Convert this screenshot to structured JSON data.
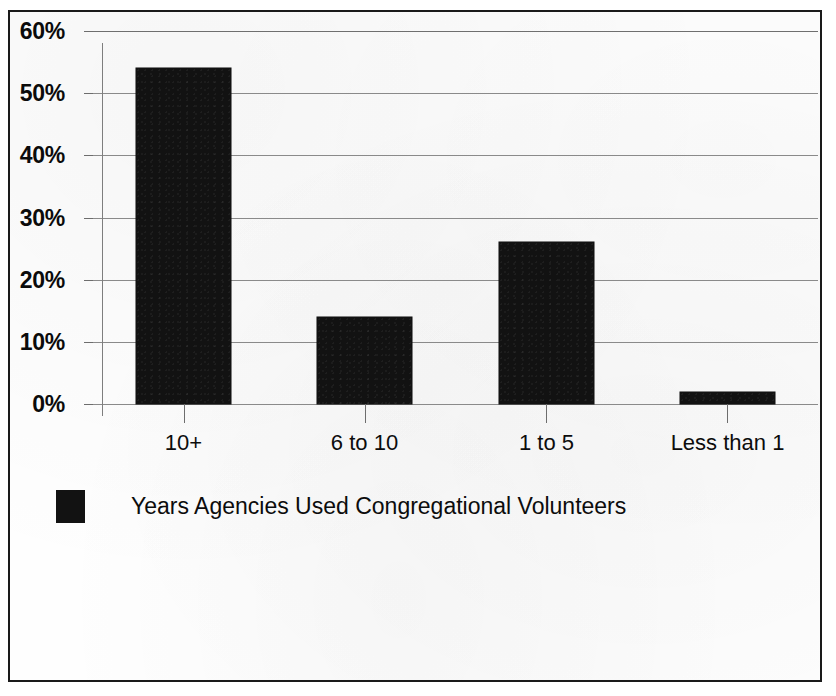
{
  "chart_data": {
    "type": "bar",
    "title": "",
    "subtitle": "",
    "xlabel": "",
    "ylabel": "",
    "categories": [
      "10+",
      "6 to 10",
      "1 to 5",
      "Less than 1"
    ],
    "values": [
      54,
      14,
      26,
      2
    ],
    "value_format": "percent",
    "ylim": [
      0,
      60
    ],
    "ytick_values": [
      60,
      50,
      40,
      30,
      20,
      10,
      0
    ],
    "ytick_labels": [
      "60%",
      "50%",
      "40%",
      "30%",
      "20%",
      "10%",
      "0%"
    ],
    "grid": true,
    "grid_axis": "y",
    "legend": {
      "position": "bottom-left",
      "entries": [
        {
          "label": "Years Agencies Used Congregational Volunteers",
          "color": "#121212"
        }
      ]
    },
    "series": [
      {
        "name": "Years Agencies Used Congregational Volunteers",
        "color": "#121212",
        "values": [
          54,
          14,
          26,
          2
        ]
      }
    ],
    "colors": {
      "bar": "#121212",
      "gridline": "#8a8a8a",
      "axis": "#7e7e7e",
      "frame": "#1a1a1a",
      "text": "#0c0c0c",
      "background": "#ffffff"
    }
  }
}
